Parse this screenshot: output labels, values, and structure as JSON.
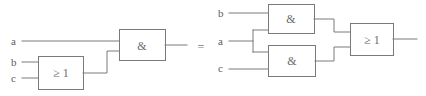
{
  "diagram": {
    "equality_symbol": "=",
    "left_circuit": {
      "name": "left-circuit",
      "expression_inputs": [
        "a",
        "b",
        "c"
      ],
      "inputs": [
        {
          "label": "a",
          "x": 14,
          "y": 45
        },
        {
          "label": "b",
          "x": 14,
          "y": 66
        },
        {
          "label": "c",
          "x": 14,
          "y": 82
        }
      ],
      "gates": [
        {
          "id": "or-gate-1",
          "type": "or",
          "symbol": "≥ 1",
          "x": 38,
          "y": 56,
          "w": 45,
          "h": 34,
          "inputs": [
            "b",
            "c"
          ]
        },
        {
          "id": "and-gate-1",
          "type": "and",
          "symbol": "&",
          "x": 119,
          "y": 29,
          "w": 46,
          "h": 31,
          "inputs": [
            "a",
            "or-gate-1"
          ]
        }
      ],
      "output": {
        "id": "left-output",
        "x": 187,
        "y": 45
      }
    },
    "right_circuit": {
      "name": "right-circuit",
      "expression_inputs": [
        "b",
        "a",
        "c"
      ],
      "inputs": [
        {
          "label": "b",
          "x": 221,
          "y": 17
        },
        {
          "label": "a",
          "x": 221,
          "y": 45
        },
        {
          "label": "c",
          "x": 221,
          "y": 72
        }
      ],
      "gates": [
        {
          "id": "and-gate-2",
          "type": "and",
          "symbol": "&",
          "x": 268,
          "y": 4,
          "w": 46,
          "h": 29,
          "inputs": [
            "b",
            "a"
          ]
        },
        {
          "id": "and-gate-3",
          "type": "and",
          "symbol": "&",
          "x": 268,
          "y": 45,
          "w": 47,
          "h": 31,
          "inputs": [
            "a",
            "c"
          ]
        },
        {
          "id": "or-gate-2",
          "type": "or",
          "symbol": "≥ 1",
          "x": 350,
          "y": 23,
          "w": 43,
          "h": 32,
          "inputs": [
            "and-gate-2",
            "and-gate-3"
          ]
        }
      ],
      "output": {
        "id": "right-output",
        "x": 417,
        "y": 39
      }
    },
    "colors": {
      "wire": "#7a7a7a",
      "gate_border": "#7a7a7a",
      "gate_fill": "#ffffff",
      "label_text": "#5c5c5c",
      "background": "#ffffff"
    }
  }
}
